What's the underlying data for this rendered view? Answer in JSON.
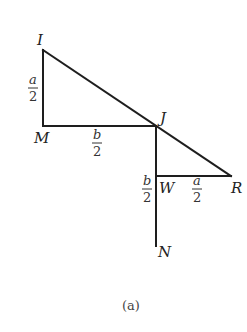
{
  "figure": {
    "caption": "(a)",
    "points": {
      "I": {
        "label": "I",
        "x": 43,
        "y": 50
      },
      "M": {
        "label": "M",
        "x": 43,
        "y": 126
      },
      "J": {
        "label": "J",
        "x": 156,
        "y": 126
      },
      "W": {
        "label": "W",
        "x": 156,
        "y": 176
      },
      "R": {
        "label": "R",
        "x": 231,
        "y": 176
      },
      "N": {
        "label": "N",
        "x": 156,
        "y": 246
      }
    },
    "segments": [
      {
        "from": "I",
        "to": "M"
      },
      {
        "from": "M",
        "to": "J"
      },
      {
        "from": "I",
        "to": "R"
      },
      {
        "from": "J",
        "to": "N"
      },
      {
        "from": "W",
        "to": "R"
      }
    ],
    "dimensions": {
      "IM": {
        "numerator": "a",
        "denominator": "2"
      },
      "MJ": {
        "numerator": "b",
        "denominator": "2"
      },
      "JW": {
        "numerator": "b",
        "denominator": "2"
      },
      "WR": {
        "numerator": "a",
        "denominator": "2"
      }
    }
  }
}
